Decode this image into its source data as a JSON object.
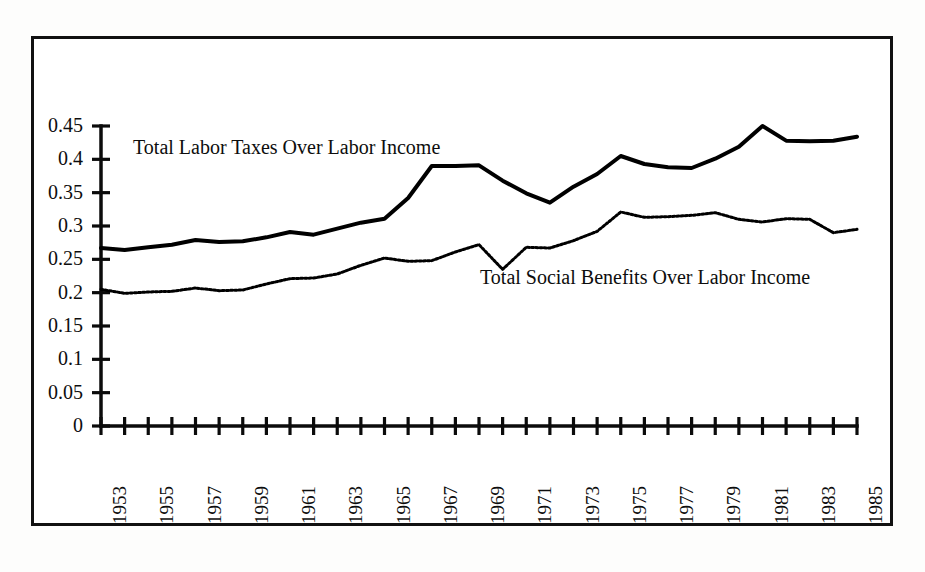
{
  "figure": {
    "background_color": "#ffffff",
    "frame_color": "#111111",
    "series_line_color": "#000000"
  },
  "chart_data": {
    "type": "line",
    "title": "",
    "subtitle": "",
    "xlabel": "",
    "ylabel": "",
    "xlim": [
      1953,
      1985
    ],
    "ylim": [
      0,
      0.45
    ],
    "grid": false,
    "legend_position": "inline-annotation",
    "y_ticks": [
      0,
      0.05,
      0.1,
      0.15,
      0.2,
      0.25,
      0.3,
      0.35,
      0.4,
      0.45
    ],
    "y_tick_labels": [
      "0",
      "0.05",
      "0.1",
      "0.15",
      "0.2",
      "0.25",
      "0.3",
      "0.35",
      "0.4",
      "0.45"
    ],
    "x_ticks": [
      1953,
      1954,
      1955,
      1956,
      1957,
      1958,
      1959,
      1960,
      1961,
      1962,
      1963,
      1964,
      1965,
      1966,
      1967,
      1968,
      1969,
      1970,
      1971,
      1972,
      1973,
      1974,
      1975,
      1976,
      1977,
      1978,
      1979,
      1980,
      1981,
      1982,
      1983,
      1984,
      1985
    ],
    "x_tick_labels": [
      "1953",
      "",
      "1955",
      "",
      "1957",
      "",
      "1959",
      "",
      "1961",
      "",
      "1963",
      "",
      "1965",
      "",
      "1967",
      "",
      "1969",
      "",
      "1971",
      "",
      "1973",
      "",
      "1975",
      "",
      "1977",
      "",
      "1979",
      "",
      "1981",
      "",
      "1983",
      "",
      "1985"
    ],
    "x_tick_label_rotation": 90,
    "x": [
      1953,
      1954,
      1955,
      1956,
      1957,
      1958,
      1959,
      1960,
      1961,
      1962,
      1963,
      1964,
      1965,
      1966,
      1967,
      1968,
      1969,
      1970,
      1971,
      1972,
      1973,
      1974,
      1975,
      1976,
      1977,
      1978,
      1979,
      1980,
      1981,
      1982,
      1983,
      1984,
      1985
    ],
    "series": [
      {
        "name": "Total Labor Taxes Over Labor Income",
        "style": "solid",
        "line_width": 4,
        "color": "#000000",
        "values": [
          0.267,
          0.264,
          0.268,
          0.272,
          0.279,
          0.276,
          0.277,
          0.283,
          0.291,
          0.287,
          0.296,
          0.305,
          0.311,
          0.342,
          0.39,
          0.39,
          0.391,
          0.368,
          0.349,
          0.335,
          0.359,
          0.378,
          0.405,
          0.393,
          0.388,
          0.387,
          0.401,
          0.419,
          0.45,
          0.428,
          0.427,
          0.428,
          0.434
        ]
      },
      {
        "name": "Total Social Benefits Over Labor Income",
        "style": "dotted",
        "line_width": 3,
        "color": "#000000",
        "values": [
          0.205,
          0.199,
          0.201,
          0.202,
          0.207,
          0.203,
          0.204,
          0.213,
          0.221,
          0.222,
          0.228,
          0.241,
          0.252,
          0.247,
          0.248,
          0.261,
          0.272,
          0.235,
          0.268,
          0.267,
          0.278,
          0.292,
          0.321,
          0.313,
          0.314,
          0.316,
          0.32,
          0.31,
          0.306,
          0.311,
          0.31,
          0.29,
          0.295
        ]
      }
    ],
    "annotations": [
      {
        "text": "Total Labor Taxes Over Labor Income",
        "x": 1954.5,
        "y": 0.415
      },
      {
        "text": "Total Social Benefits Over Labor Income",
        "x": 1969.0,
        "y": 0.247
      }
    ]
  }
}
